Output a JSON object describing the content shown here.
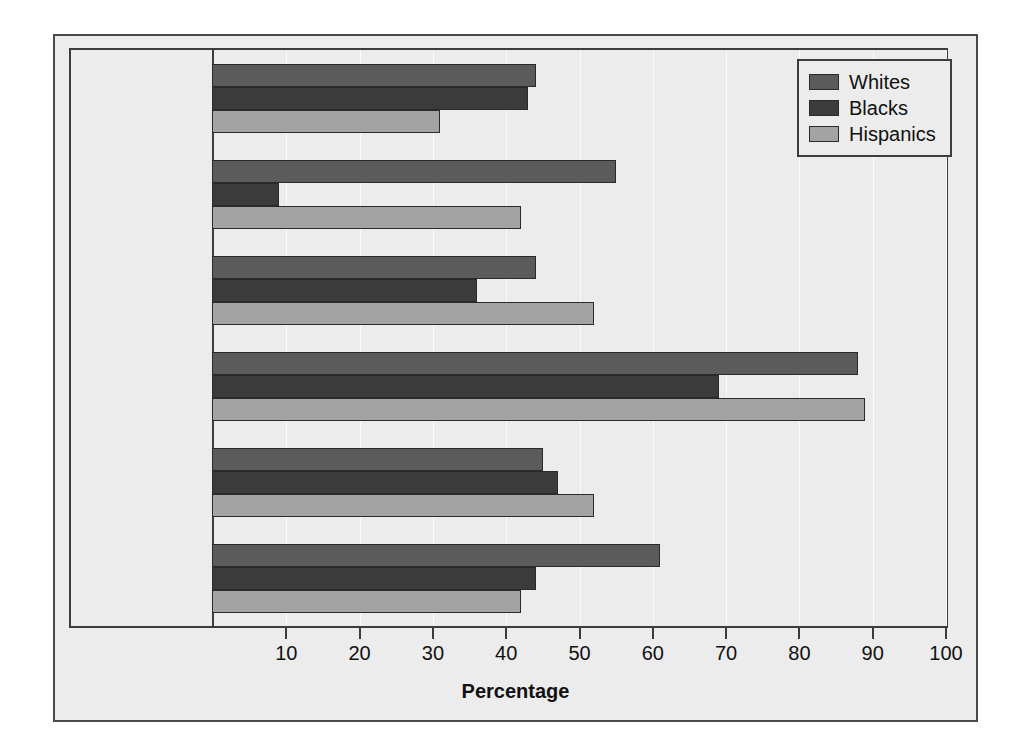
{
  "chart_data": {
    "type": "bar",
    "orientation": "horizontal",
    "title": "",
    "xlabel": "Percentage",
    "ylabel": "",
    "xlim": [
      0,
      100
    ],
    "xticks": [
      10,
      20,
      30,
      40,
      50,
      60,
      70,
      80,
      90,
      100
    ],
    "xtick_labels": [
      "10",
      "20",
      "30",
      "40",
      "50",
      "60",
      "70",
      "80",
      "90",
      "100"
    ],
    "grid": true,
    "legend_position": "top-right",
    "categories": [
      "Think abortion\ngenerally acceptable",
      "Voted for\nGeorge W. Bush",
      "Feel women and\nmen have equal\nopportunities",
      "Support President\nGeorge W. Bush\npost 9/11",
      "Support school\nvouchers",
      "Think police treat\nall races fairly"
    ],
    "series": [
      {
        "name": "Whites",
        "color": "#5b5b5b",
        "values": [
          44,
          55,
          44,
          88,
          45,
          61
        ]
      },
      {
        "name": "Blacks",
        "color": "#3b3b3b",
        "values": [
          43,
          9,
          36,
          69,
          47,
          44
        ]
      },
      {
        "name": "Hispanics",
        "color": "#a3a3a3",
        "values": [
          31,
          42,
          52,
          89,
          52,
          42
        ]
      }
    ]
  },
  "legend": {
    "items": [
      {
        "label": "Whites"
      },
      {
        "label": "Blacks"
      },
      {
        "label": "Hispanics"
      }
    ]
  },
  "axis": {
    "x_title": "Percentage"
  }
}
